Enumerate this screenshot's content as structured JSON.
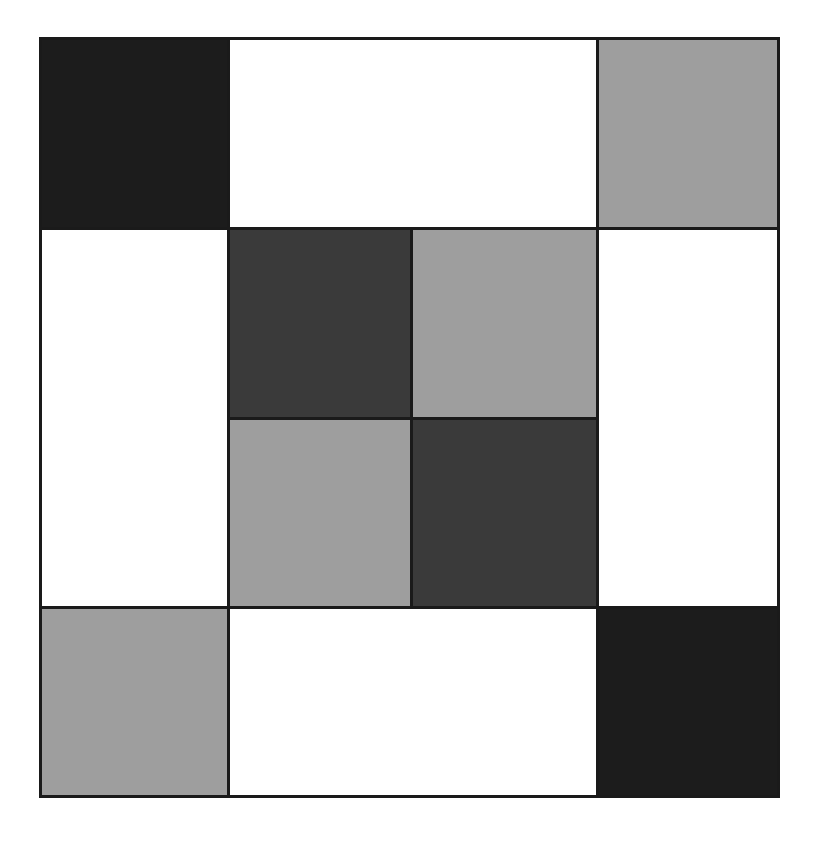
{
  "diagram": {
    "type": "quilt-block",
    "grid": {
      "rows": 4,
      "cols": 4
    },
    "colors": {
      "black": "#1c1c1c",
      "dark": "#3a3a3a",
      "gray": "#9e9e9e",
      "white": "#ffffff",
      "line": "#1a1a1a"
    },
    "cells": [
      {
        "id": "top-left-corner",
        "row": 0,
        "col": 0,
        "rowspan": 1,
        "colspan": 1,
        "fill": "black"
      },
      {
        "id": "top-middle-bar",
        "row": 0,
        "col": 1,
        "rowspan": 1,
        "colspan": 2,
        "fill": "white"
      },
      {
        "id": "top-right-corner",
        "row": 0,
        "col": 3,
        "rowspan": 1,
        "colspan": 1,
        "fill": "gray"
      },
      {
        "id": "left-middle-bar",
        "row": 1,
        "col": 0,
        "rowspan": 2,
        "colspan": 1,
        "fill": "white"
      },
      {
        "id": "center-top-left",
        "row": 1,
        "col": 1,
        "rowspan": 1,
        "colspan": 1,
        "fill": "dark"
      },
      {
        "id": "center-top-right",
        "row": 1,
        "col": 2,
        "rowspan": 1,
        "colspan": 1,
        "fill": "gray"
      },
      {
        "id": "right-middle-bar",
        "row": 1,
        "col": 3,
        "rowspan": 2,
        "colspan": 1,
        "fill": "white"
      },
      {
        "id": "center-bottom-left",
        "row": 2,
        "col": 1,
        "rowspan": 1,
        "colspan": 1,
        "fill": "gray"
      },
      {
        "id": "center-bottom-right",
        "row": 2,
        "col": 2,
        "rowspan": 1,
        "colspan": 1,
        "fill": "dark"
      },
      {
        "id": "bottom-left-corner",
        "row": 3,
        "col": 0,
        "rowspan": 1,
        "colspan": 1,
        "fill": "gray"
      },
      {
        "id": "bottom-middle-bar",
        "row": 3,
        "col": 1,
        "rowspan": 1,
        "colspan": 2,
        "fill": "white"
      },
      {
        "id": "bottom-right-corner",
        "row": 3,
        "col": 3,
        "rowspan": 1,
        "colspan": 1,
        "fill": "black"
      }
    ]
  }
}
